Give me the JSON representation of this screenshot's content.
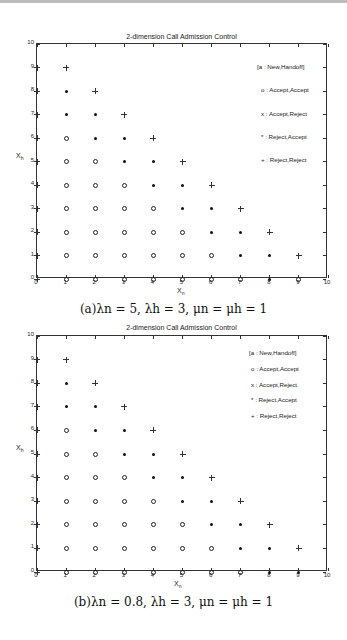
{
  "chart_data": [
    {
      "type": "scatter",
      "title": "2-dimension Call Admission Control",
      "xlabel": "X_n",
      "ylabel": "X_h",
      "xlim": [
        0,
        10
      ],
      "ylim": [
        0,
        10
      ],
      "xticks": [
        0,
        1,
        2,
        3,
        4,
        5,
        6,
        7,
        8,
        9,
        10
      ],
      "yticks": [
        0,
        1,
        2,
        3,
        4,
        5,
        6,
        7,
        8,
        9,
        10
      ],
      "grid": false,
      "legend_position": "upper right (inside)",
      "legend": [
        "[a : New,Handoff]",
        "o : Accept,Accept",
        "x : Accept,Reject",
        "* : Reject,Accept",
        "+ : Reject,Reject"
      ],
      "caption": "(a)λn = 5, λh = 3, μn = μh = 1",
      "series": [
        {
          "name": "Accept,Accept",
          "marker": "o",
          "points": [
            [
              1,
              0
            ],
            [
              2,
              0
            ],
            [
              3,
              0
            ],
            [
              4,
              0
            ],
            [
              5,
              0
            ],
            [
              6,
              0
            ],
            [
              7,
              0
            ],
            [
              9,
              0
            ],
            [
              1,
              1
            ],
            [
              2,
              1
            ],
            [
              3,
              1
            ],
            [
              4,
              1
            ],
            [
              5,
              1
            ],
            [
              6,
              1
            ],
            [
              1,
              2
            ],
            [
              2,
              2
            ],
            [
              3,
              2
            ],
            [
              4,
              2
            ],
            [
              5,
              2
            ],
            [
              1,
              3
            ],
            [
              2,
              3
            ],
            [
              3,
              3
            ],
            [
              4,
              3
            ],
            [
              1,
              4
            ],
            [
              2,
              4
            ],
            [
              3,
              4
            ],
            [
              1,
              5
            ],
            [
              2,
              5
            ],
            [
              1,
              6
            ]
          ]
        },
        {
          "name": "Reject,Accept",
          "marker": "*",
          "points": [
            [
              8,
              0
            ],
            [
              7,
              1
            ],
            [
              8,
              1
            ],
            [
              6,
              2
            ],
            [
              7,
              2
            ],
            [
              5,
              3
            ],
            [
              6,
              3
            ],
            [
              4,
              4
            ],
            [
              5,
              4
            ],
            [
              3,
              5
            ],
            [
              4,
              5
            ],
            [
              2,
              6
            ],
            [
              3,
              6
            ],
            [
              1,
              7
            ],
            [
              2,
              7
            ],
            [
              1,
              8
            ]
          ]
        },
        {
          "name": "Reject,Reject",
          "marker": "+",
          "points": [
            [
              9,
              1
            ],
            [
              8,
              2
            ],
            [
              7,
              3
            ],
            [
              6,
              4
            ],
            [
              5,
              5
            ],
            [
              4,
              6
            ],
            [
              3,
              7
            ],
            [
              2,
              8
            ],
            [
              1,
              9
            ]
          ]
        }
      ]
    },
    {
      "type": "scatter",
      "title": "2-dimension Call Admission Control",
      "xlabel": "X_n",
      "ylabel": "X_h",
      "xlim": [
        0,
        10
      ],
      "ylim": [
        0,
        10
      ],
      "xticks": [
        0,
        1,
        2,
        3,
        4,
        5,
        6,
        7,
        8,
        9,
        10
      ],
      "yticks": [
        0,
        1,
        2,
        3,
        4,
        5,
        6,
        7,
        8,
        9,
        10
      ],
      "grid": false,
      "legend_position": "upper right (inside)",
      "legend": [
        "[a : New,Handoff]",
        "o : Accept,Accept",
        "x : Accept,Reject",
        "* : Reject,Accept",
        "+ : Reject,Reject"
      ],
      "caption": "(b)λn = 0.8, λh = 3, μn = μh = 1",
      "series": [
        {
          "name": "Accept,Accept",
          "marker": "o",
          "points": [
            [
              1,
              0
            ],
            [
              2,
              0
            ],
            [
              3,
              0
            ],
            [
              4,
              0
            ],
            [
              5,
              0
            ],
            [
              6,
              0
            ],
            [
              7,
              0
            ],
            [
              1,
              1
            ],
            [
              2,
              1
            ],
            [
              3,
              1
            ],
            [
              4,
              1
            ],
            [
              5,
              1
            ],
            [
              6,
              1
            ],
            [
              1,
              2
            ],
            [
              2,
              2
            ],
            [
              3,
              2
            ],
            [
              4,
              2
            ],
            [
              5,
              2
            ],
            [
              1,
              3
            ],
            [
              2,
              3
            ],
            [
              3,
              3
            ],
            [
              4,
              3
            ],
            [
              1,
              4
            ],
            [
              2,
              4
            ],
            [
              3,
              4
            ],
            [
              1,
              5
            ],
            [
              2,
              5
            ],
            [
              1,
              6
            ]
          ]
        },
        {
          "name": "Reject,Accept",
          "marker": "*",
          "points": [
            [
              8,
              0
            ],
            [
              9,
              0
            ],
            [
              7,
              1
            ],
            [
              8,
              1
            ],
            [
              6,
              2
            ],
            [
              7,
              2
            ],
            [
              5,
              3
            ],
            [
              6,
              3
            ],
            [
              4,
              4
            ],
            [
              5,
              4
            ],
            [
              3,
              5
            ],
            [
              4,
              5
            ],
            [
              2,
              6
            ],
            [
              3,
              6
            ],
            [
              1,
              7
            ],
            [
              2,
              7
            ],
            [
              1,
              8
            ]
          ]
        },
        {
          "name": "Reject,Reject",
          "marker": "+",
          "points": [
            [
              9,
              1
            ],
            [
              8,
              2
            ],
            [
              7,
              3
            ],
            [
              6,
              4
            ],
            [
              5,
              5
            ],
            [
              4,
              6
            ],
            [
              3,
              7
            ],
            [
              2,
              8
            ],
            [
              1,
              9
            ]
          ]
        }
      ]
    }
  ],
  "figures": [
    {
      "title": "2-dimension Call Admission Control",
      "xlabel": "X",
      "xlabel_sub": "n",
      "ylabel": "X",
      "ylabel_sub": "h",
      "legend": [
        "[a : New,Handoff]",
        "o : Accept,Accept",
        "x : Accept,Reject",
        "* : Reject,Accept",
        "+ : Reject,Reject"
      ],
      "caption": "(a)λn = 5, λh = 3, μn = μh = 1"
    },
    {
      "title": "2-dimension Call Admission Control",
      "xlabel": "X",
      "xlabel_sub": "n",
      "ylabel": "X",
      "ylabel_sub": "h",
      "legend": [
        "[a : New,Handoff]",
        "o : Accept,Accept",
        "x : Accept,Reject",
        "* : Reject,Accept",
        "+ : Reject,Reject"
      ],
      "caption": "(b)λn = 0.8, λh = 3, μn = μh = 1"
    }
  ],
  "tick_labels": [
    "0",
    "1",
    "2",
    "3",
    "4",
    "5",
    "6",
    "7",
    "8",
    "9",
    "10"
  ]
}
